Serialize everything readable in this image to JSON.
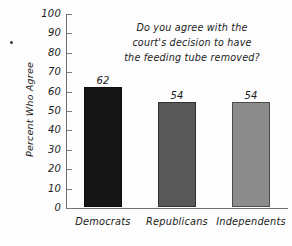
{
  "chart_data": {
    "type": "bar",
    "title_lines": [
      "Do you agree with the",
      "court's decision to have",
      "the feeding tube removed?"
    ],
    "categories": [
      "Democrats",
      "Republicans",
      "Independents"
    ],
    "values": [
      62,
      54,
      54
    ],
    "value_labels": [
      "62",
      "54",
      "54"
    ],
    "bar_colors": [
      "#151515",
      "#585858",
      "#8c8c8c"
    ],
    "xlabel": "",
    "ylabel": "Percent Who Agree",
    "ylim": [
      0,
      100
    ],
    "ytick_step": 10,
    "ytick_labels": [
      "100",
      "90",
      "80",
      "70",
      "60",
      "50",
      "40",
      "30",
      "20",
      "10",
      "0"
    ],
    "ytick_values": [
      100,
      90,
      80,
      70,
      60,
      50,
      40,
      30,
      20,
      10,
      0
    ],
    "grid": false,
    "legend": "none",
    "axis_color": "#6d6d6d",
    "text_color": "#1c1c1c",
    "background": "#fdfdfd"
  }
}
